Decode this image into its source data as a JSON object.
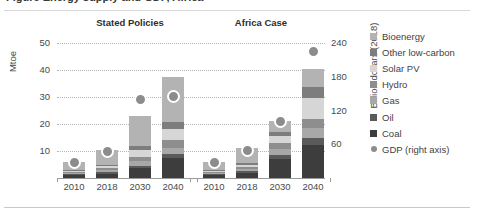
{
  "figure": {
    "title_clipped": "Figure  Energy supply and GDP, Africa",
    "left_axis_title": "Mtoe",
    "right_axis_title": "Billion dollars (2018)"
  },
  "groups": [
    {
      "id": "stated-policies",
      "label": "Stated Policies"
    },
    {
      "id": "africa-case",
      "label": "Africa Case"
    }
  ],
  "legend": {
    "items": [
      {
        "label": "Bioenergy",
        "color": "#b3b3b3",
        "marker": "square"
      },
      {
        "label": "Other low-carbon",
        "color": "#7d7d7d",
        "marker": "square"
      },
      {
        "label": "Solar PV",
        "color": "#d6d6d6",
        "marker": "square"
      },
      {
        "label": "Hydro",
        "color": "#8e8e8e",
        "marker": "square"
      },
      {
        "label": "Gas",
        "color": "#a8a8a8",
        "marker": "square"
      },
      {
        "label": "Oil",
        "color": "#5a5a5a",
        "marker": "square"
      },
      {
        "label": "Coal",
        "color": "#3d3d3d",
        "marker": "square"
      },
      {
        "label": "GDP (right axis)",
        "color": "#8c8c8c",
        "marker": "circle"
      }
    ]
  },
  "chart_data": {
    "type": "bar",
    "title": "Energy supply and GDP, Africa",
    "xlabel": "",
    "ylabel": "Mtoe",
    "y2label": "Billion dollars (2018)",
    "ylim": [
      0,
      55
    ],
    "y2lim": [
      0,
      264
    ],
    "yticks": [
      10,
      20,
      30,
      40,
      50
    ],
    "y2ticks": [
      60,
      120,
      180,
      240
    ],
    "grid": true,
    "legend_position": "right",
    "stacked": true,
    "categories": [
      "2010",
      "2018",
      "2030",
      "2040"
    ],
    "panels": [
      {
        "name": "Stated Policies",
        "series": [
          {
            "name": "Coal",
            "values": [
              1.0,
              1.6,
              3.6,
              7.3
            ]
          },
          {
            "name": "Oil",
            "values": [
              0.4,
              0.5,
              1.0,
              1.6
            ]
          },
          {
            "name": "Gas",
            "values": [
              0.5,
              0.8,
              1.6,
              2.4
            ]
          },
          {
            "name": "Hydro",
            "values": [
              0.5,
              0.8,
              1.8,
              2.8
            ]
          },
          {
            "name": "Solar PV",
            "values": [
              0.2,
              0.6,
              2.4,
              4.2
            ]
          },
          {
            "name": "Other low-carbon",
            "values": [
              0.3,
              0.6,
              1.6,
              2.6
            ]
          },
          {
            "name": "Bioenergy",
            "values": [
              2.9,
              5.6,
              11.0,
              16.6
            ]
          }
        ],
        "gdp_right_axis": [
          27,
          47,
          140,
          146
        ]
      },
      {
        "name": "Africa Case",
        "series": [
          {
            "name": "Coal",
            "values": [
              1.0,
              1.9,
              7.2,
              12.4
            ]
          },
          {
            "name": "Oil",
            "values": [
              0.4,
              0.6,
              1.5,
              2.6
            ]
          },
          {
            "name": "Gas",
            "values": [
              0.5,
              0.8,
              2.2,
              3.6
            ]
          },
          {
            "name": "Hydro",
            "values": [
              0.5,
              0.9,
              2.0,
              3.4
            ]
          },
          {
            "name": "Solar PV",
            "values": [
              0.2,
              0.7,
              2.6,
              7.8
            ]
          },
          {
            "name": "Other low-carbon",
            "values": [
              0.3,
              0.6,
              1.5,
              4.2
            ]
          },
          {
            "name": "Bioenergy",
            "values": [
              2.9,
              5.7,
              4.2,
              6.4
            ]
          }
        ],
        "gdp_right_axis": [
          27,
          49,
          100,
          225
        ]
      }
    ]
  }
}
